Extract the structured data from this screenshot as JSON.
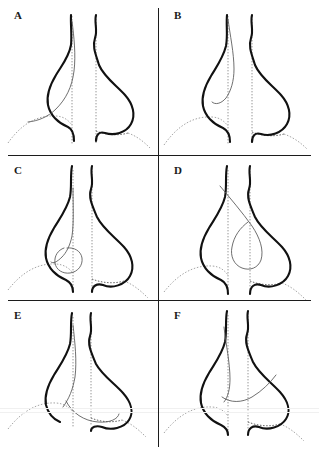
{
  "figure": {
    "title": "",
    "layout": {
      "rows": 3,
      "cols": 2,
      "panel_count": 6
    },
    "colors": {
      "background": "#ffffff",
      "thick_curve": "#111111",
      "thin_curve": "#555555",
      "dotted_reference": "#8a8a8a",
      "divider": "#1c1c1c"
    },
    "panels": [
      {
        "label": "A",
        "thin_curve_name": "broad-leaning-loop",
        "thin_curve_description": "wide thin arc descending from the left vertical reference line and sweeping down-left to the baseline"
      },
      {
        "label": "B",
        "thin_curve_name": "narrow-tall-loop",
        "thin_curve_description": "slender thin loop rising along the left vertical reference line with a rounded lower tip"
      },
      {
        "label": "C",
        "thin_curve_name": "small-circular-loop",
        "thin_curve_description": "small thin circular loop low between the two vertical reference lines"
      },
      {
        "label": "D",
        "thin_curve_name": "long-diagonal-loop",
        "thin_curve_description": "long thin loop crossing diagonally from upper left down to the right side"
      },
      {
        "label": "E",
        "thin_curve_name": "low-flat-loop",
        "thin_curve_description": "thin flattened loop hugging the baseline toward the right"
      },
      {
        "label": "F",
        "thin_curve_name": "diagonal-tail",
        "thin_curve_description": "thin curve with a tail extending up to the upper right of the right lobe"
      }
    ],
    "common_elements": {
      "thick_pair": "two thick teardrop-shaped closed curves forming a left and right lobe with long necks rising to the top",
      "vertical_reference_lines": 2,
      "baseline": "dotted arch curve crossing the lower part of each panel"
    }
  }
}
